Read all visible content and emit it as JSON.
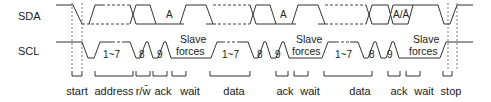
{
  "signals": {
    "sda": "SDA",
    "scl": "SCL"
  },
  "sda_marks": {
    "ack1": "A",
    "ack2": "A",
    "ack3": "A/Ā"
  },
  "scl_marks": {
    "bits1": "1~7",
    "bit8_1": "8",
    "bit9_1": "9",
    "bits2": "1~7",
    "bit8_2": "8",
    "bit9_2": "9",
    "bits3": "1~7",
    "bit8_3": "8",
    "bit9_3": "9",
    "slave1_a": "Slave",
    "slave1_b": "forces",
    "slave2_a": "Slave",
    "slave2_b": "forces",
    "slave3_a": "Slave",
    "slave3_b": "forces"
  },
  "phases": [
    {
      "label": "start"
    },
    {
      "label": "address"
    },
    {
      "label": "r/w̄"
    },
    {
      "label": "ack"
    },
    {
      "label": "wait"
    },
    {
      "label": "data"
    },
    {
      "label": "ack"
    },
    {
      "label": "wait"
    },
    {
      "label": "data"
    },
    {
      "label": "ack"
    },
    {
      "label": "wait"
    },
    {
      "label": "stop"
    }
  ]
}
